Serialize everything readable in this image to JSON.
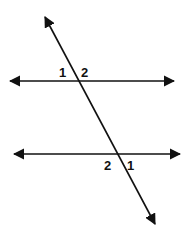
{
  "diagram": {
    "title": "",
    "colors": {
      "line": "#111111",
      "background": "#ffffff"
    },
    "lines": [
      {
        "id": "parallel-top",
        "x1": 8,
        "y1": 81,
        "x2": 176,
        "y2": 81,
        "arrows": "both"
      },
      {
        "id": "parallel-bottom",
        "x1": 12,
        "y1": 154,
        "x2": 182,
        "y2": 154,
        "arrows": "both"
      },
      {
        "id": "transversal",
        "x1": 44,
        "y1": 15,
        "x2": 156,
        "y2": 226,
        "arrows": "both"
      }
    ],
    "angle_labels": {
      "top_left": "1",
      "top_right": "2",
      "bottom_left": "2",
      "bottom_right": "1"
    }
  }
}
